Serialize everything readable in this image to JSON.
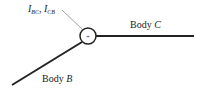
{
  "diagram": {
    "joint_label": {
      "I1": "I",
      "sub1": "BC",
      "sep": ", ",
      "I2": "I",
      "sub2": "CB"
    },
    "joint_symbol": "+",
    "body_c": {
      "prefix": "Body ",
      "name": "C"
    },
    "body_b": {
      "prefix": "Body ",
      "name": "B"
    },
    "colors": {
      "line": "#222222",
      "leader": "#777777"
    }
  }
}
